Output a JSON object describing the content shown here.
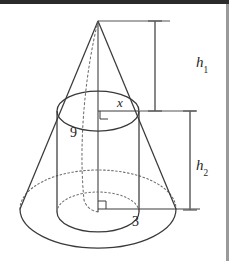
{
  "figure": {
    "kind": "geometry-diagram",
    "stroke_color": "#3a3a3a",
    "hidden_stroke_color": "#6e6e6e",
    "background_color": "#ffffff",
    "top_band_color": "#2b2b2b",
    "right_strip_color": "#9a9a9a",
    "labels": [
      {
        "id": "h1",
        "text": "h",
        "subscript": "1",
        "x": 196,
        "y": 62,
        "font_size": 15,
        "italic": true
      },
      {
        "id": "h2",
        "text": "h",
        "subscript": "2",
        "x": 196,
        "y": 165,
        "font_size": 15,
        "italic": true
      },
      {
        "id": "x",
        "text": "x",
        "subscript": "",
        "x": 117,
        "y": 100,
        "font_size": 13,
        "italic": true
      },
      {
        "id": "nine",
        "text": "9",
        "subscript": "",
        "x": 70,
        "y": 131,
        "font_size": 14,
        "italic": false
      },
      {
        "id": "three",
        "text": "3",
        "subscript": "",
        "x": 132,
        "y": 219,
        "font_size": 14,
        "italic": false
      }
    ],
    "geometry": {
      "apex": {
        "x": 98,
        "y": 21
      },
      "cone_base_center": {
        "x": 98,
        "y": 209
      },
      "cone_base_rx": 78,
      "cone_base_ry": 39,
      "cylinder_top_center": {
        "x": 98,
        "y": 111
      },
      "cylinder_bottom_center": {
        "x": 98,
        "y": 212
      },
      "cylinder_rx": 41,
      "cylinder_ry": 20,
      "h1_bar_x": 155,
      "h1_bar_top": 21,
      "h1_bar_bottom": 111,
      "h2_bar_x": 190,
      "h2_bar_top": 111,
      "h2_bar_bottom": 210
    }
  }
}
